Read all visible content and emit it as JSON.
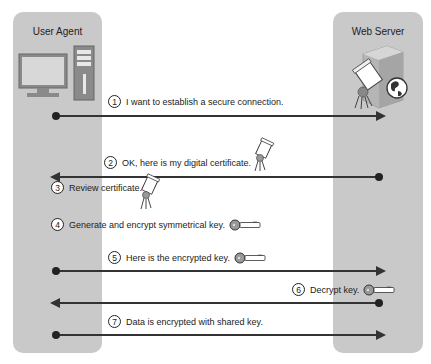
{
  "participants": {
    "left": {
      "label": "User Agent",
      "icon": "desktop-computer-icon"
    },
    "right": {
      "label": "Web Server",
      "icon": "server-with-certificate-and-globe-icon"
    }
  },
  "steps": [
    {
      "number": "1",
      "text": "I want to establish a secure connection.",
      "direction": "client-to-server",
      "icon": null
    },
    {
      "number": "2",
      "text": "OK, here is my digital certificate.",
      "direction": "server-to-client",
      "icon": "certificate-icon"
    },
    {
      "number": "3",
      "text": "Review certificate.",
      "direction": "local-client",
      "icon": "certificate-icon"
    },
    {
      "number": "4",
      "text": "Generate and encrypt symmetrical key.",
      "direction": "local-client",
      "icon": "key-icon"
    },
    {
      "number": "5",
      "text": "Here is the encrypted key.",
      "direction": "client-to-server",
      "icon": "key-icon"
    },
    {
      "number": "6",
      "text": "Decrypt key.",
      "direction": "server-to-client",
      "icon": "key-icon"
    },
    {
      "number": "7",
      "text": "Data is encrypted with shared key.",
      "direction": "client-to-server",
      "icon": null
    }
  ],
  "colors": {
    "panel": "#c9c9c9",
    "line": "#333333",
    "background": "#ffffff"
  }
}
